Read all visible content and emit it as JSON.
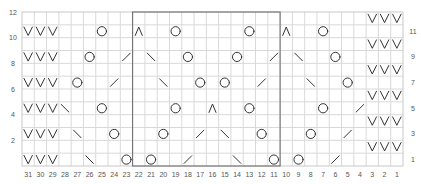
{
  "columns": 31,
  "rows": 12,
  "column_labels": [
    "31",
    "30",
    "29",
    "28",
    "27",
    "26",
    "25",
    "24",
    "23",
    "22",
    "21",
    "20",
    "19",
    "18",
    "17",
    "16",
    "15",
    "14",
    "13",
    "12",
    "11",
    "10",
    "9",
    "8",
    "7",
    "6",
    "5",
    "4",
    "3",
    "2",
    "1"
  ],
  "left_row_labels": [
    "12",
    "10",
    "8",
    "6",
    "4",
    "2"
  ],
  "right_row_labels": [
    "11",
    "9",
    "7",
    "5",
    "3",
    "1"
  ],
  "repeat_box": {
    "from_col": 22,
    "to_col": 11
  },
  "symbol_legend": {
    "V": "slip-stitch-icon",
    "O": "yarn-over-icon",
    "/": "k2tog-icon",
    "\\": "ssk-icon",
    "A": "double-decrease-icon"
  },
  "cells": [
    {
      "row": 12,
      "col": 3,
      "sym": "V"
    },
    {
      "row": 12,
      "col": 2,
      "sym": "V"
    },
    {
      "row": 12,
      "col": 1,
      "sym": "V"
    },
    {
      "row": 11,
      "col": 31,
      "sym": "V"
    },
    {
      "row": 11,
      "col": 30,
      "sym": "V"
    },
    {
      "row": 11,
      "col": 29,
      "sym": "V"
    },
    {
      "row": 11,
      "col": 25,
      "sym": "O"
    },
    {
      "row": 11,
      "col": 22,
      "sym": "A"
    },
    {
      "row": 11,
      "col": 19,
      "sym": "O"
    },
    {
      "row": 11,
      "col": 13,
      "sym": "O"
    },
    {
      "row": 11,
      "col": 10,
      "sym": "A"
    },
    {
      "row": 11,
      "col": 7,
      "sym": "O"
    },
    {
      "row": 10,
      "col": 3,
      "sym": "V"
    },
    {
      "row": 10,
      "col": 2,
      "sym": "V"
    },
    {
      "row": 10,
      "col": 1,
      "sym": "V"
    },
    {
      "row": 9,
      "col": 31,
      "sym": "V"
    },
    {
      "row": 9,
      "col": 30,
      "sym": "V"
    },
    {
      "row": 9,
      "col": 29,
      "sym": "V"
    },
    {
      "row": 9,
      "col": 26,
      "sym": "O"
    },
    {
      "row": 9,
      "col": 23,
      "sym": "/"
    },
    {
      "row": 9,
      "col": 21,
      "sym": "\\"
    },
    {
      "row": 9,
      "col": 18,
      "sym": "O"
    },
    {
      "row": 9,
      "col": 14,
      "sym": "O"
    },
    {
      "row": 9,
      "col": 11,
      "sym": "/"
    },
    {
      "row": 9,
      "col": 9,
      "sym": "\\"
    },
    {
      "row": 9,
      "col": 6,
      "sym": "O"
    },
    {
      "row": 8,
      "col": 3,
      "sym": "V"
    },
    {
      "row": 8,
      "col": 2,
      "sym": "V"
    },
    {
      "row": 8,
      "col": 1,
      "sym": "V"
    },
    {
      "row": 7,
      "col": 31,
      "sym": "V"
    },
    {
      "row": 7,
      "col": 30,
      "sym": "V"
    },
    {
      "row": 7,
      "col": 29,
      "sym": "V"
    },
    {
      "row": 7,
      "col": 27,
      "sym": "O"
    },
    {
      "row": 7,
      "col": 24,
      "sym": "/"
    },
    {
      "row": 7,
      "col": 20,
      "sym": "\\"
    },
    {
      "row": 7,
      "col": 17,
      "sym": "O"
    },
    {
      "row": 7,
      "col": 15,
      "sym": "O"
    },
    {
      "row": 7,
      "col": 12,
      "sym": "/"
    },
    {
      "row": 7,
      "col": 8,
      "sym": "\\"
    },
    {
      "row": 7,
      "col": 5,
      "sym": "O"
    },
    {
      "row": 6,
      "col": 3,
      "sym": "V"
    },
    {
      "row": 6,
      "col": 2,
      "sym": "V"
    },
    {
      "row": 6,
      "col": 1,
      "sym": "V"
    },
    {
      "row": 5,
      "col": 31,
      "sym": "V"
    },
    {
      "row": 5,
      "col": 30,
      "sym": "V"
    },
    {
      "row": 5,
      "col": 29,
      "sym": "V"
    },
    {
      "row": 5,
      "col": 28,
      "sym": "\\"
    },
    {
      "row": 5,
      "col": 25,
      "sym": "O"
    },
    {
      "row": 5,
      "col": 19,
      "sym": "O"
    },
    {
      "row": 5,
      "col": 16,
      "sym": "A"
    },
    {
      "row": 5,
      "col": 13,
      "sym": "O"
    },
    {
      "row": 5,
      "col": 7,
      "sym": "O"
    },
    {
      "row": 5,
      "col": 4,
      "sym": "/"
    },
    {
      "row": 4,
      "col": 3,
      "sym": "V"
    },
    {
      "row": 4,
      "col": 2,
      "sym": "V"
    },
    {
      "row": 4,
      "col": 1,
      "sym": "V"
    },
    {
      "row": 3,
      "col": 31,
      "sym": "V"
    },
    {
      "row": 3,
      "col": 30,
      "sym": "V"
    },
    {
      "row": 3,
      "col": 29,
      "sym": "V"
    },
    {
      "row": 3,
      "col": 27,
      "sym": "\\"
    },
    {
      "row": 3,
      "col": 24,
      "sym": "O"
    },
    {
      "row": 3,
      "col": 20,
      "sym": "O"
    },
    {
      "row": 3,
      "col": 17,
      "sym": "/"
    },
    {
      "row": 3,
      "col": 15,
      "sym": "\\"
    },
    {
      "row": 3,
      "col": 12,
      "sym": "O"
    },
    {
      "row": 3,
      "col": 8,
      "sym": "O"
    },
    {
      "row": 3,
      "col": 5,
      "sym": "/"
    },
    {
      "row": 2,
      "col": 3,
      "sym": "V"
    },
    {
      "row": 2,
      "col": 2,
      "sym": "V"
    },
    {
      "row": 2,
      "col": 1,
      "sym": "V"
    },
    {
      "row": 1,
      "col": 31,
      "sym": "V"
    },
    {
      "row": 1,
      "col": 30,
      "sym": "V"
    },
    {
      "row": 1,
      "col": 29,
      "sym": "V"
    },
    {
      "row": 1,
      "col": 26,
      "sym": "\\"
    },
    {
      "row": 1,
      "col": 23,
      "sym": "O"
    },
    {
      "row": 1,
      "col": 21,
      "sym": "O"
    },
    {
      "row": 1,
      "col": 18,
      "sym": "/"
    },
    {
      "row": 1,
      "col": 14,
      "sym": "\\"
    },
    {
      "row": 1,
      "col": 11,
      "sym": "O"
    },
    {
      "row": 1,
      "col": 9,
      "sym": "O"
    },
    {
      "row": 1,
      "col": 6,
      "sym": "/"
    }
  ]
}
